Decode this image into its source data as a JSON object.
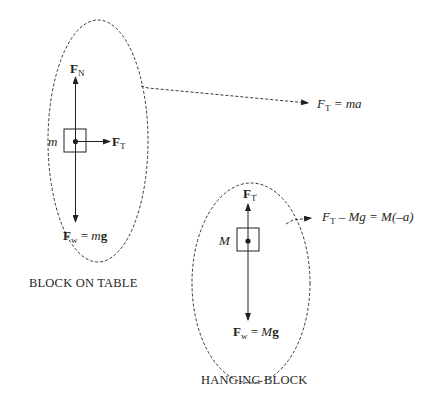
{
  "left_diagram": {
    "mass_label": "m",
    "normal_force": {
      "symbol": "F",
      "subscript": "N"
    },
    "tension_force": {
      "symbol": "F",
      "subscript": "T"
    },
    "weight_force": {
      "symbol": "F",
      "subscript": "w",
      "equals": "=",
      "mass": "m",
      "g": "g"
    },
    "caption": "BLOCK ON TABLE",
    "equation": {
      "lhs_symbol": "F",
      "lhs_subscript": "T",
      "rest": " = ma"
    }
  },
  "right_diagram": {
    "mass_label": "M",
    "tension_force": {
      "symbol": "F",
      "subscript": "T"
    },
    "weight_force": {
      "symbol": "F",
      "subscript": "w",
      "equals": "=",
      "mass": "M",
      "g": "g"
    },
    "caption": "HANGING BLOCK",
    "equation": {
      "lhs_symbol": "F",
      "lhs_subscript": "T",
      "rest": " – Mg = M(–a)"
    }
  },
  "colors": {
    "ink": "#231f20",
    "background": "#ffffff"
  }
}
